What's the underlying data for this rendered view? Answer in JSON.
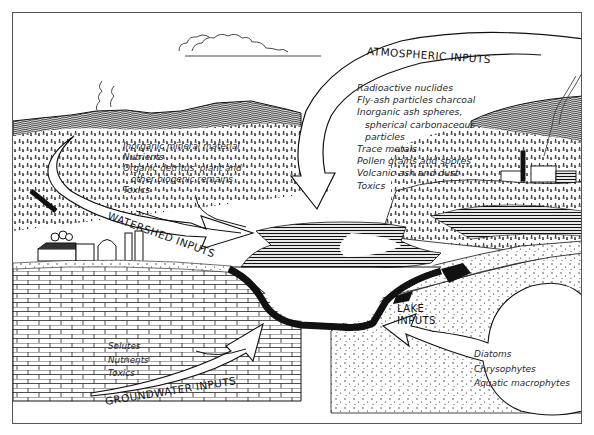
{
  "figure": {
    "atmospheric": {
      "title": "ATMOSPHERIC INPUTS",
      "items": [
        "Radioactive nuclides",
        "Fly-ash particles charcoal",
        "Inorganic ash spheres,",
        "spherical carbonaceous",
        "particles",
        "Trace metals",
        "Pollen grains and spores",
        "Volcanic ash and dust",
        "Toxics"
      ]
    },
    "watershed": {
      "title": "WATERSHED INPUTS",
      "items": [
        "Inorganic mineral material",
        "Nutrients",
        "Organic detritus, plant and",
        "other biogenic remains",
        "Toxics"
      ]
    },
    "groundwater": {
      "title": "GROUNDWATER INPUTS",
      "items": [
        "Solutes",
        "Nutrients",
        "Toxics"
      ]
    },
    "lake": {
      "title_line1": "LAKE",
      "title_line2": "INPUTS",
      "items": [
        "Diatoms",
        "Chrysophytes",
        "Aquatic macrophytes"
      ]
    },
    "colors": {
      "ink": "#1a1a1a",
      "paper": "#ffffff",
      "frame": "#555555"
    }
  }
}
